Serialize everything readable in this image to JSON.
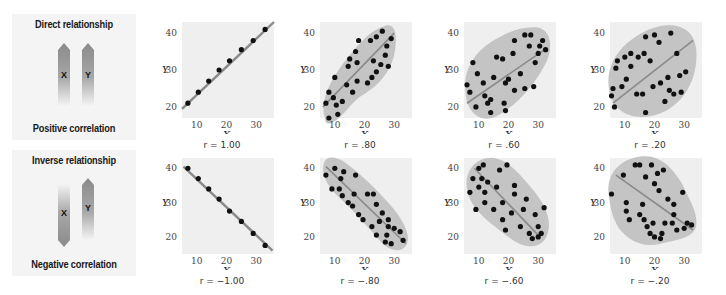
{
  "rows": [
    {
      "title": "Direct relationship",
      "subtitle": "Positive correlation",
      "arrow_x_label": "X",
      "arrow_y_label": "Y",
      "x_arrow_dir": "up",
      "y_arrow_dir": "up"
    },
    {
      "title": "Inverse relationship",
      "subtitle": "Negative correlation",
      "arrow_x_label": "X",
      "arrow_y_label": "Y",
      "x_arrow_dir": "down",
      "y_arrow_dir": "up"
    }
  ],
  "axis": {
    "xlabel": "X",
    "ylabel": "Y",
    "xticks": [
      "10",
      "20",
      "30"
    ],
    "yticks": [
      "40",
      "30",
      "20"
    ]
  },
  "colors": {
    "plot_bg": "#efefef",
    "ellipse": "#c4c4c4",
    "line": "#8a8a8a",
    "dot": "#111111",
    "arrow_dark": "#8c8c8c"
  },
  "chart_data": [
    {
      "type": "scatter",
      "title": "r = 1.00",
      "r_label": "r = 1.00",
      "xlabel": "X",
      "ylabel": "Y",
      "xlim": [
        5,
        36
      ],
      "ylim": [
        17,
        43
      ],
      "points": [
        [
          7,
          21
        ],
        [
          10.5,
          24
        ],
        [
          14,
          27
        ],
        [
          17.5,
          30
        ],
        [
          21,
          32.5
        ],
        [
          25,
          35.5
        ],
        [
          29,
          38
        ],
        [
          33,
          41
        ]
      ],
      "line": [
        [
          5,
          19.5
        ],
        [
          36,
          43
        ]
      ],
      "envelope": null
    },
    {
      "type": "scatter",
      "title": "r = .80",
      "r_label": "r = .80",
      "xlabel": "X",
      "ylabel": "Y",
      "xlim": [
        5,
        36
      ],
      "ylim": [
        17,
        43
      ],
      "points": [
        [
          7,
          21
        ],
        [
          8,
          17
        ],
        [
          8,
          24
        ],
        [
          9.5,
          22.5
        ],
        [
          10,
          28
        ],
        [
          10.5,
          20.5
        ],
        [
          11,
          18
        ],
        [
          12.5,
          21.5
        ],
        [
          14,
          26
        ],
        [
          14.5,
          31
        ],
        [
          15,
          33
        ],
        [
          16,
          24
        ],
        [
          17,
          35
        ],
        [
          17.5,
          27
        ],
        [
          17.5,
          32
        ],
        [
          18,
          38
        ],
        [
          21,
          26.5
        ],
        [
          22,
          38
        ],
        [
          22.5,
          28
        ],
        [
          23,
          32.5
        ],
        [
          24,
          29.5
        ],
        [
          24,
          39
        ],
        [
          25.5,
          31.5
        ],
        [
          26,
          40.5
        ],
        [
          27,
          34
        ],
        [
          27.5,
          36.5
        ],
        [
          28,
          31
        ],
        [
          29,
          38.5
        ]
      ],
      "line": [
        [
          6,
          20
        ],
        [
          30,
          40
        ]
      ],
      "envelope": "M6.5,17.5 C5,22 9,28 14,33 C18,37 22,41 27,42 C31,43 31,38 30,34 C28,28 23,25 19,23 C15,21 12,16 8,15.5 C7,15.5 6.8,16 6.5,17.5 Z"
    },
    {
      "type": "scatter",
      "title": "r = .60",
      "r_label": "r = .60",
      "xlabel": "X",
      "ylabel": "Y",
      "xlim": [
        5,
        36
      ],
      "ylim": [
        17,
        43
      ],
      "points": [
        [
          6,
          26
        ],
        [
          7,
          24
        ],
        [
          8,
          32
        ],
        [
          9,
          20
        ],
        [
          9.5,
          29
        ],
        [
          11.5,
          26.5
        ],
        [
          12,
          23
        ],
        [
          13,
          21
        ],
        [
          14,
          18.5
        ],
        [
          14,
          22
        ],
        [
          15,
          28
        ],
        [
          16,
          33.5
        ],
        [
          18,
          33
        ],
        [
          18.5,
          21
        ],
        [
          19,
          26.5
        ],
        [
          19,
          19
        ],
        [
          20,
          27.5
        ],
        [
          21.5,
          34.5
        ],
        [
          22,
          24.5
        ],
        [
          22,
          38
        ],
        [
          24,
          29
        ],
        [
          25.5,
          25
        ],
        [
          25.5,
          39.5
        ],
        [
          27,
          36.5
        ],
        [
          27.5,
          39.5
        ],
        [
          28.5,
          25.5
        ],
        [
          29,
          32
        ],
        [
          30,
          34.5
        ],
        [
          30.5,
          36.5
        ],
        [
          31.5,
          38
        ],
        [
          32.5,
          35.5
        ]
      ],
      "line": [
        [
          6,
          21
        ],
        [
          33,
          36
        ]
      ],
      "envelope": "M5.5,24 C4.5,30 9,35 14,37.5 C19,40 24,42 30,41.5 C35,40.5 35,35 32,31 C28,25 22,20 16,17.5 C11,15.5 6,18 5.5,24 Z"
    },
    {
      "type": "scatter",
      "title": "r = .20",
      "r_label": "r = .20",
      "xlabel": "X",
      "ylabel": "Y",
      "xlim": [
        5,
        36
      ],
      "ylim": [
        17,
        43
      ],
      "points": [
        [
          5.5,
          23
        ],
        [
          6,
          25
        ],
        [
          6.5,
          20
        ],
        [
          7,
          30.5
        ],
        [
          7.5,
          32.5
        ],
        [
          9,
          25.5
        ],
        [
          10,
          33.5
        ],
        [
          10.5,
          27.5
        ],
        [
          12,
          34.5
        ],
        [
          12,
          31
        ],
        [
          14,
          23.5
        ],
        [
          14.5,
          33.5
        ],
        [
          16,
          23.5
        ],
        [
          16.5,
          34.5
        ],
        [
          17,
          39
        ],
        [
          17,
          18.5
        ],
        [
          18.5,
          32.5
        ],
        [
          19.5,
          25.5
        ],
        [
          20,
          39.5
        ],
        [
          21.5,
          37.5
        ],
        [
          22,
          26.5
        ],
        [
          23.5,
          21.5
        ],
        [
          24.5,
          28
        ],
        [
          25,
          24.5
        ],
        [
          25.5,
          40
        ],
        [
          26.5,
          23.5
        ],
        [
          27.5,
          34.5
        ],
        [
          28.5,
          28.5
        ],
        [
          29,
          24
        ],
        [
          30.5,
          29.5
        ]
      ],
      "line": [
        [
          6,
          21
        ],
        [
          33,
          38
        ]
      ],
      "envelope": "M4.5,26 C4,33 10,38 18,41 C26,43.5 33,42 34,36 C35,29 31,22 24,19 C16,15.5 5,17 4.5,26 Z"
    },
    {
      "type": "scatter",
      "title": "r = -1.00",
      "r_label": "r = −1.00",
      "xlabel": "X",
      "ylabel": "Y",
      "xlim": [
        5,
        36
      ],
      "ylim": [
        15,
        43
      ],
      "points": [
        [
          7,
          40
        ],
        [
          10.5,
          37
        ],
        [
          14,
          34
        ],
        [
          17.5,
          31
        ],
        [
          21,
          27.5
        ],
        [
          25,
          24.5
        ],
        [
          29,
          21
        ],
        [
          33,
          17.5
        ]
      ],
      "line": [
        [
          5.5,
          40.5
        ],
        [
          35.5,
          16
        ]
      ],
      "envelope": null
    },
    {
      "type": "scatter",
      "title": "r = -.80",
      "r_label": "r = −.80",
      "xlabel": "X",
      "ylabel": "Y",
      "xlim": [
        5,
        36
      ],
      "ylim": [
        15,
        43
      ],
      "points": [
        [
          7,
          38
        ],
        [
          9,
          34
        ],
        [
          10,
          40
        ],
        [
          11.5,
          34
        ],
        [
          12,
          37
        ],
        [
          12.5,
          32
        ],
        [
          13,
          39
        ],
        [
          14.5,
          30
        ],
        [
          16,
          29
        ],
        [
          16.5,
          32.5
        ],
        [
          17,
          38
        ],
        [
          18,
          26.5
        ],
        [
          19.5,
          25
        ],
        [
          21,
          32.5
        ],
        [
          22.5,
          23
        ],
        [
          23,
          32.5
        ],
        [
          24,
          29.5
        ],
        [
          24,
          20.5
        ],
        [
          25,
          24.5
        ],
        [
          26,
          27
        ],
        [
          27,
          18.5
        ],
        [
          27.5,
          20.5
        ],
        [
          28,
          25
        ],
        [
          28,
          23
        ],
        [
          29,
          18
        ],
        [
          30,
          22.5
        ],
        [
          32,
          21.5
        ],
        [
          33,
          19
        ]
      ],
      "line": [
        [
          7,
          40.5
        ],
        [
          34,
          18
        ]
      ],
      "envelope": "M6.5,42 C5,39 7,35 12,31 C17,27 21,23 25,19 C28,16 32,15 34,17.5 C36,20 33,25 29,29 C24,34 18,39 13,42 C10,43.5 7.5,43.5 6.5,42 Z"
    },
    {
      "type": "scatter",
      "title": "r = -.60",
      "r_label": "r = −.60",
      "xlabel": "X",
      "ylabel": "Y",
      "xlim": [
        5,
        36
      ],
      "ylim": [
        15,
        43
      ],
      "points": [
        [
          7,
          33
        ],
        [
          8,
          37
        ],
        [
          9,
          28
        ],
        [
          10,
          40
        ],
        [
          10,
          34.5
        ],
        [
          11,
          37
        ],
        [
          11.5,
          41
        ],
        [
          12,
          30
        ],
        [
          12,
          33
        ],
        [
          13,
          36
        ],
        [
          15,
          28
        ],
        [
          16,
          34.5
        ],
        [
          17,
          39.5
        ],
        [
          18,
          30
        ],
        [
          18,
          25
        ],
        [
          19,
          22
        ],
        [
          19.5,
          41
        ],
        [
          21,
          27
        ],
        [
          22,
          35
        ],
        [
          22,
          32.5
        ],
        [
          24,
          23
        ],
        [
          25,
          28
        ],
        [
          26,
          31
        ],
        [
          27,
          21
        ],
        [
          28,
          19.5
        ],
        [
          29,
          26.5
        ],
        [
          30,
          23
        ],
        [
          30,
          20
        ],
        [
          31,
          21
        ],
        [
          32,
          28.5
        ]
      ],
      "line": [
        [
          8.5,
          40
        ],
        [
          30,
          20.5
        ]
      ],
      "envelope": "M6,34 C5,39 9,43.5 15,43 C20,42.5 24,38 28,34 C32,30 35,25 33,20.5 C31,16 25,16.5 20,20 C14,24 7,28 6,34 Z"
    },
    {
      "type": "scatter",
      "title": "r = -.20",
      "r_label": "r = −.20",
      "xlabel": "X",
      "ylabel": "Y",
      "xlim": [
        5,
        36
      ],
      "ylim": [
        15,
        43
      ],
      "points": [
        [
          5.5,
          32.5
        ],
        [
          9.5,
          38
        ],
        [
          10.5,
          30
        ],
        [
          10.5,
          27.5
        ],
        [
          11.5,
          25
        ],
        [
          13.5,
          41
        ],
        [
          15,
          26.5
        ],
        [
          15,
          41
        ],
        [
          16,
          29.5
        ],
        [
          16.5,
          25
        ],
        [
          17,
          37.5
        ],
        [
          17.5,
          23
        ],
        [
          18.5,
          21
        ],
        [
          19,
          41
        ],
        [
          19.5,
          24
        ],
        [
          20,
          20
        ],
        [
          20,
          35.5
        ],
        [
          21,
          38.5
        ],
        [
          21.5,
          33.5
        ],
        [
          22,
          19.5
        ],
        [
          22.5,
          21
        ],
        [
          23,
          39.5
        ],
        [
          23.5,
          24
        ],
        [
          24.5,
          31
        ],
        [
          26,
          24
        ],
        [
          26.5,
          26.5
        ],
        [
          26.5,
          29.5
        ],
        [
          27.5,
          22
        ],
        [
          29.5,
          33
        ],
        [
          30,
          22.5
        ],
        [
          31,
          24
        ],
        [
          32.5,
          23.5
        ]
      ],
      "line": [
        [
          7,
          38
        ],
        [
          33,
          22
        ]
      ],
      "envelope": "M4.5,33 C4,39 9,43 16,43.5 C22,44 26,40 29,36 C31,32 35,27 34,23 C33,19.5 27,19 22,18 C17,17 12,18 8,22.5 C5.5,26 5,29 4.5,33 Z"
    }
  ]
}
